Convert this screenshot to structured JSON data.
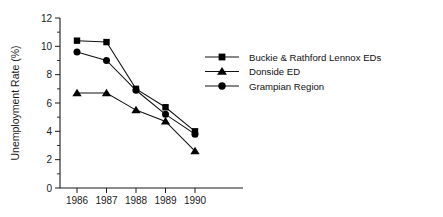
{
  "chart_data": {
    "type": "line",
    "title": "",
    "xlabel": "",
    "ylabel": "Unemployment Rate (%)",
    "categories": [
      "1986",
      "1987",
      "1988",
      "1989",
      "1990"
    ],
    "x": [
      1986,
      1987,
      1988,
      1989,
      1990
    ],
    "ylim": [
      0,
      12
    ],
    "yticks": [
      0,
      2,
      4,
      6,
      8,
      10,
      12
    ],
    "ytick_labels": [
      "0",
      "2",
      "4",
      "6",
      "8",
      "10",
      "12"
    ],
    "grid": false,
    "legend_position": "right",
    "series": [
      {
        "name": "Buckie & Rathford Lennox EDs",
        "marker": "square",
        "values": [
          10.4,
          10.3,
          7.0,
          5.7,
          4.0
        ]
      },
      {
        "name": "Donside ED",
        "marker": "triangle",
        "values": [
          6.7,
          6.7,
          5.5,
          4.7,
          2.6
        ]
      },
      {
        "name": "Grampian Region",
        "marker": "circle",
        "values": [
          9.6,
          9.0,
          6.9,
          5.2,
          3.8
        ]
      }
    ]
  }
}
